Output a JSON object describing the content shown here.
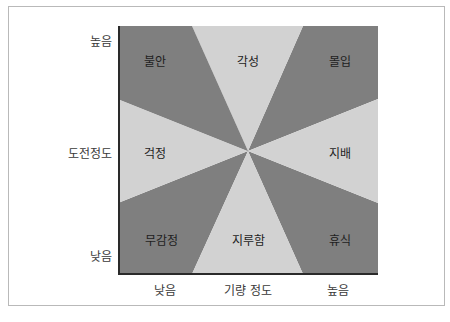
{
  "diagram": {
    "type": "flow-channel-model",
    "y_axis": {
      "title": "도전정도",
      "high": "높음",
      "low": "낮음"
    },
    "x_axis": {
      "title": "기량 정도",
      "low": "낮음",
      "high": "높음"
    },
    "sectors": [
      {
        "id": "anxiety",
        "label": "불안",
        "shade": "dark"
      },
      {
        "id": "arousal",
        "label": "각성",
        "shade": "light"
      },
      {
        "id": "flow",
        "label": "몰입",
        "shade": "dark"
      },
      {
        "id": "worry",
        "label": "걱정",
        "shade": "light"
      },
      {
        "id": "control",
        "label": "지배",
        "shade": "light"
      },
      {
        "id": "apathy",
        "label": "무감정",
        "shade": "dark"
      },
      {
        "id": "boredom",
        "label": "지루함",
        "shade": "light"
      },
      {
        "id": "relaxation",
        "label": "휴식",
        "shade": "dark"
      }
    ],
    "colors": {
      "dark": "#7f7f7f",
      "light": "#d2d2d2",
      "axis": "#2a2a2a",
      "frame": "#b9b9b9"
    }
  }
}
